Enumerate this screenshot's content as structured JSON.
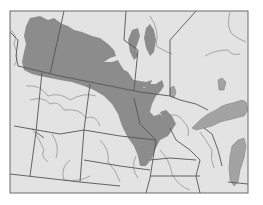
{
  "map": {
    "title": "",
    "labels": [],
    "colors": {
      "background": "#ffffff",
      "land": "#e3e3e3",
      "frame": "#6a6a6a",
      "boundary": "#555555",
      "river": "#9a9a9a",
      "shaded_region": "#8c8c8c",
      "lake": "#a3a3a3"
    },
    "frame": {
      "x": 10,
      "y": 11,
      "width": 238,
      "height": 182
    },
    "features": [
      "shaded-range-region",
      "great-lakes",
      "state-province-boundaries",
      "rivers"
    ]
  }
}
